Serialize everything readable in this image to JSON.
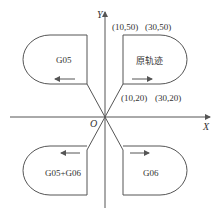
{
  "axes": {
    "x_label": "X",
    "y_label": "Y",
    "origin_label": "O"
  },
  "points": {
    "p1": "(10,50)",
    "p2": "(30,50)",
    "p3": "(10,20)",
    "p4": "(30,20)"
  },
  "shapes": {
    "top_right": {
      "label": "原轨迹",
      "arrow": "right"
    },
    "top_left": {
      "label": "G05",
      "arrow": "left"
    },
    "bottom_left": {
      "label": "G05+G06",
      "arrow": "left"
    },
    "bottom_right": {
      "label": "G06",
      "arrow": "right"
    }
  },
  "colors": {
    "stroke": "#555555",
    "text": "#333333",
    "background": "#ffffff"
  }
}
